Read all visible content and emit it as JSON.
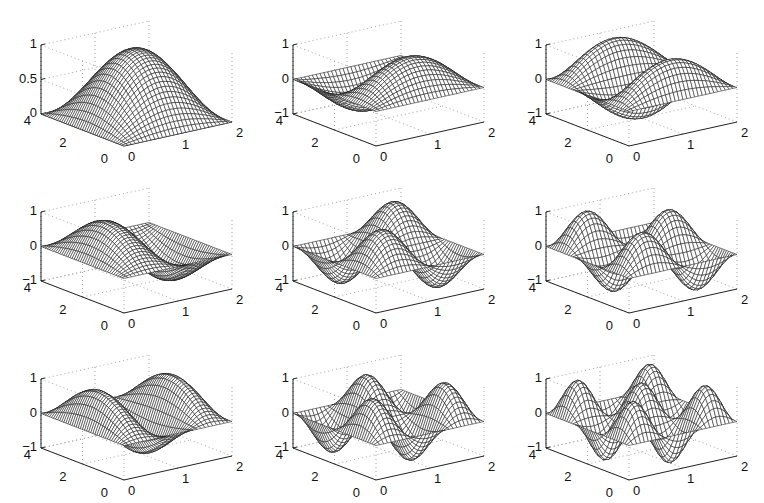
{
  "figure": {
    "rows": 3,
    "cols": 3,
    "background": "#ffffff",
    "mesh_color": "#1a1a1a",
    "grid_color": "#9a9a9a"
  },
  "chart_data": [
    {
      "type": "surface",
      "row": 0,
      "col": 0,
      "n": 1,
      "m": 1,
      "function": "sin(1*pi*x/2)*sin(1*pi*y/4)",
      "xlim": [
        0,
        2
      ],
      "ylim": [
        0,
        4
      ],
      "zlim": [
        0,
        1
      ],
      "xticks": [
        "0",
        "1",
        "2"
      ],
      "yticks": [
        "0",
        "2",
        "4"
      ],
      "zticks": [
        "0",
        "0.5",
        "1"
      ],
      "grid": true
    },
    {
      "type": "surface",
      "row": 0,
      "col": 1,
      "n": 1,
      "m": 2,
      "function": "sin(1*pi*x/2)*sin(2*pi*y/4)",
      "xlim": [
        0,
        2
      ],
      "ylim": [
        0,
        4
      ],
      "zlim": [
        -1,
        1
      ],
      "xticks": [
        "0",
        "1",
        "2"
      ],
      "yticks": [
        "0",
        "2",
        "4"
      ],
      "zticks": [
        "-1",
        "0",
        "1"
      ],
      "grid": true
    },
    {
      "type": "surface",
      "row": 0,
      "col": 2,
      "n": 1,
      "m": 3,
      "function": "sin(1*pi*x/2)*sin(3*pi*y/4)",
      "xlim": [
        0,
        2
      ],
      "ylim": [
        0,
        4
      ],
      "zlim": [
        -1,
        1
      ],
      "xticks": [
        "0",
        "1",
        "2"
      ],
      "yticks": [
        "0",
        "2",
        "4"
      ],
      "zticks": [
        "-1",
        "0",
        "1"
      ],
      "grid": true
    },
    {
      "type": "surface",
      "row": 1,
      "col": 0,
      "n": 2,
      "m": 1,
      "function": "sin(2*pi*x/2)*sin(1*pi*y/4)",
      "xlim": [
        0,
        2
      ],
      "ylim": [
        0,
        4
      ],
      "zlim": [
        -1,
        1
      ],
      "xticks": [
        "0",
        "1",
        "2"
      ],
      "yticks": [
        "0",
        "2",
        "4"
      ],
      "zticks": [
        "-1",
        "0",
        "1"
      ],
      "grid": true
    },
    {
      "type": "surface",
      "row": 1,
      "col": 1,
      "n": 2,
      "m": 2,
      "function": "sin(2*pi*x/2)*sin(2*pi*y/4)",
      "xlim": [
        0,
        2
      ],
      "ylim": [
        0,
        4
      ],
      "zlim": [
        -1,
        1
      ],
      "xticks": [
        "0",
        "1",
        "2"
      ],
      "yticks": [
        "0",
        "2",
        "4"
      ],
      "zticks": [
        "-1",
        "0",
        "1"
      ],
      "grid": true
    },
    {
      "type": "surface",
      "row": 1,
      "col": 2,
      "n": 2,
      "m": 3,
      "function": "sin(2*pi*x/2)*sin(3*pi*y/4)",
      "xlim": [
        0,
        2
      ],
      "ylim": [
        0,
        4
      ],
      "zlim": [
        -1,
        1
      ],
      "xticks": [
        "0",
        "1",
        "2"
      ],
      "yticks": [
        "0",
        "2",
        "4"
      ],
      "zticks": [
        "-1",
        "0",
        "1"
      ],
      "grid": true
    },
    {
      "type": "surface",
      "row": 2,
      "col": 0,
      "n": 3,
      "m": 1,
      "function": "sin(3*pi*x/2)*sin(1*pi*y/4)",
      "xlim": [
        0,
        2
      ],
      "ylim": [
        0,
        4
      ],
      "zlim": [
        -1,
        1
      ],
      "xticks": [
        "0",
        "1",
        "2"
      ],
      "yticks": [
        "0",
        "2",
        "4"
      ],
      "zticks": [
        "-1",
        "0",
        "1"
      ],
      "grid": true
    },
    {
      "type": "surface",
      "row": 2,
      "col": 1,
      "n": 3,
      "m": 2,
      "function": "sin(3*pi*x/2)*sin(2*pi*y/4)",
      "xlim": [
        0,
        2
      ],
      "ylim": [
        0,
        4
      ],
      "zlim": [
        -1,
        1
      ],
      "xticks": [
        "0",
        "1",
        "2"
      ],
      "yticks": [
        "0",
        "2",
        "4"
      ],
      "zticks": [
        "-1",
        "0",
        "1"
      ],
      "grid": true
    },
    {
      "type": "surface",
      "row": 2,
      "col": 2,
      "n": 3,
      "m": 3,
      "function": "sin(3*pi*x/2)*sin(3*pi*y/4)",
      "xlim": [
        0,
        2
      ],
      "ylim": [
        0,
        4
      ],
      "zlim": [
        -1,
        1
      ],
      "xticks": [
        "0",
        "1",
        "2"
      ],
      "yticks": [
        "0",
        "2",
        "4"
      ],
      "zticks": [
        "-1",
        "0",
        "1"
      ],
      "grid": true
    }
  ]
}
